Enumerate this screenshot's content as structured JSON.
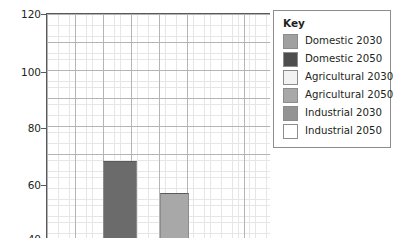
{
  "chart_data": {
    "type": "bar",
    "title": "",
    "xlabel": "",
    "ylabel": "% change",
    "ylim": [
      36,
      120
    ],
    "grid": "graph-paper minor and major gridlines",
    "y_ticks": [
      {
        "label": "120",
        "value": 120
      },
      {
        "label": "100",
        "value": 100
      },
      {
        "label": "80",
        "value": 80
      },
      {
        "label": "60",
        "value": 60
      },
      {
        "label": "40",
        "value": 40
      }
    ],
    "note_cropped": "Chart is cropped at the bottom; bars extend below the visible area and the 40 tick label is partially cut off.",
    "categories": [
      "Domestic 2030",
      "Domestic 2050"
    ],
    "series": [
      {
        "name": "bars",
        "values": [
          65,
          53
        ]
      }
    ],
    "bars": [
      {
        "label": "Domestic 2030",
        "value": 65,
        "color": "#6b6b6b"
      },
      {
        "label": "Domestic 2050",
        "value": 53,
        "color": "#a8a8a8"
      }
    ],
    "legend_position": "right outside plot",
    "legend": {
      "title": "Key",
      "entries": [
        {
          "label": "Domestic 2030",
          "color": "#a0a0a0"
        },
        {
          "label": "Domestic 2050",
          "color": "#4d4d4d"
        },
        {
          "label": "Agricultural 2030",
          "color": "#f2f2f2"
        },
        {
          "label": "Agricultural 2050",
          "color": "#a8a8a8"
        },
        {
          "label": "Industrial 2030",
          "color": "#949494"
        },
        {
          "label": "Industrial 2050",
          "color": "#ffffff"
        }
      ]
    }
  },
  "colors": {
    "axis": "#58595b",
    "grid_minor": "#e6e6e6",
    "grid_major": "#b4b4b4",
    "text": "#231f20",
    "legend_border": "#8c8c8c"
  }
}
